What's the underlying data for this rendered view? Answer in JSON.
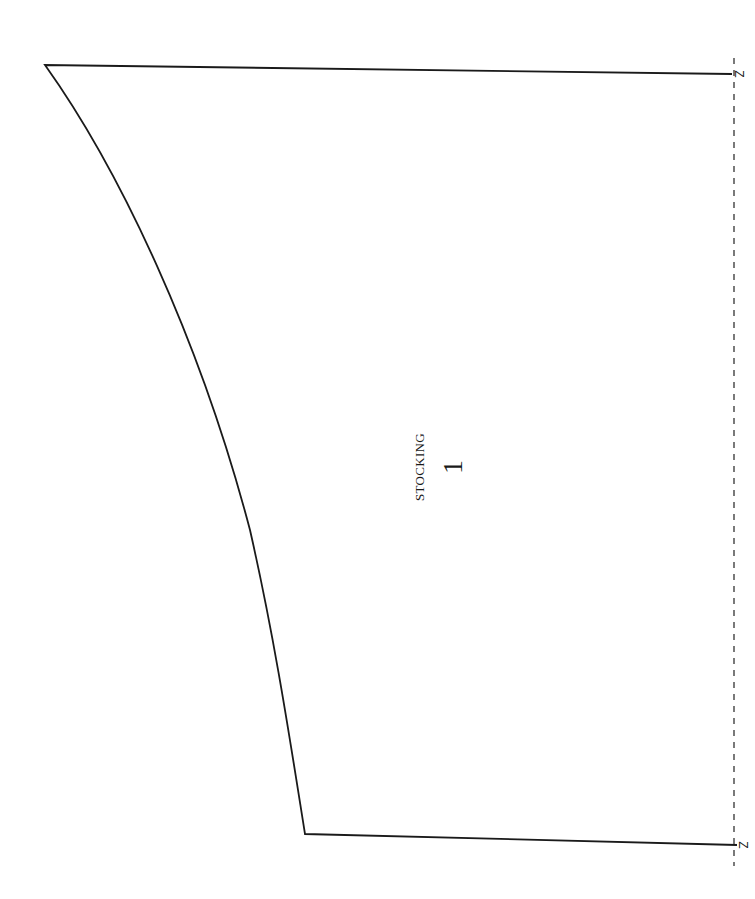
{
  "pattern_piece": {
    "name": "STOCKING",
    "number": "1",
    "notch_labels": [
      "Z",
      "Z"
    ],
    "outline": {
      "stroke_color": "#1a1a1a",
      "top_left": [
        45,
        65
      ],
      "top_right": [
        732,
        74
      ],
      "bottom_right": [
        737,
        845
      ],
      "bottom_left": [
        305,
        834
      ],
      "curve_points": [
        [
          45,
          65
        ],
        [
          133,
          200
        ],
        [
          178,
          300
        ],
        [
          243,
          500
        ],
        [
          266,
          600
        ],
        [
          305,
          834
        ]
      ]
    },
    "fold_line": {
      "style": "dashed",
      "x": 734,
      "y_start": 58,
      "y_end": 866
    }
  }
}
